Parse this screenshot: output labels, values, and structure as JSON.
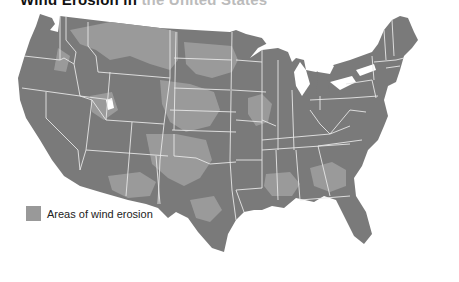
{
  "title": {
    "bold": "Wind Erosion in",
    "faded": " the United States"
  },
  "legend": {
    "label": "Areas of wind erosion",
    "swatch_color": "#9a9a9a"
  },
  "colors": {
    "land": "#7a7a7a",
    "erosion": "#999999",
    "border": "#e6e6e6",
    "water": "#ffffff"
  }
}
